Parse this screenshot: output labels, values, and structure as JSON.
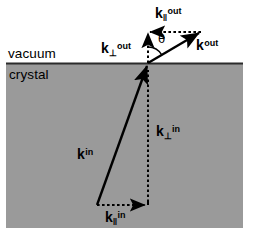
{
  "figure": {
    "canvas": {
      "width": 255,
      "height": 242
    },
    "colors": {
      "background": "#ffffff",
      "crystal_fill": "#9a9a9a",
      "vacuum_fill": "#ffffff",
      "interface_line": "#2b2b2b",
      "vector_stroke": "#000000",
      "text": "#000000"
    },
    "regions": [
      {
        "name": "vacuum",
        "label": "vacuum",
        "fill": "#ffffff"
      },
      {
        "name": "crystal",
        "label": "crystal",
        "fill": "#9a9a9a"
      }
    ],
    "interface": {
      "y": 63,
      "x_start": 6,
      "x_end": 243
    },
    "angle": {
      "symbol": "θ",
      "between": [
        "k_perp_out",
        "k_out"
      ]
    },
    "vectors": [
      {
        "id": "k_out",
        "label_base": "k",
        "label_sub": "",
        "label_sup": "out",
        "style": "solid",
        "from": [
          148,
          63
        ],
        "to": [
          201,
          32
        ]
      },
      {
        "id": "k_par_out",
        "label_base": "k",
        "label_sub": "‖",
        "label_sup": "out",
        "style": "dashed",
        "from": [
          201,
          32
        ],
        "to": [
          149,
          32
        ]
      },
      {
        "id": "k_perp_out",
        "label_base": "k",
        "label_sub": "⊥",
        "label_sup": "out",
        "style": "dashed",
        "from": [
          148,
          63
        ],
        "to": [
          148,
          33
        ]
      },
      {
        "id": "k_in",
        "label_base": "k",
        "label_sub": "",
        "label_sup": "in",
        "style": "solid",
        "from": [
          97,
          205
        ],
        "to": [
          148,
          64
        ]
      },
      {
        "id": "k_perp_in",
        "label_base": "k",
        "label_sub": "⊥",
        "label_sup": "in",
        "style": "dashed",
        "from": [
          148,
          199
        ],
        "to": [
          148,
          68
        ]
      },
      {
        "id": "k_par_in",
        "label_base": "k",
        "label_sub": "‖",
        "label_sup": "in",
        "style": "dashed",
        "from": [
          97,
          205
        ],
        "to": [
          147,
          205
        ]
      }
    ]
  }
}
